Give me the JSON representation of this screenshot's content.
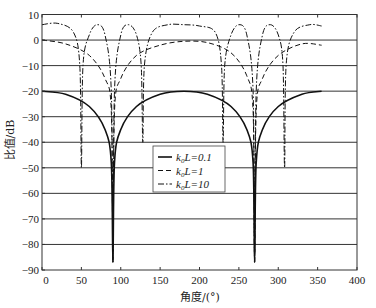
{
  "chart_data": {
    "type": "line",
    "title": "",
    "xlabel": "角度/(°)",
    "ylabel": "比值/dB",
    "xlim": [
      0,
      400
    ],
    "ylim": [
      -90,
      10
    ],
    "xticks": [
      0,
      50,
      100,
      150,
      200,
      250,
      300,
      350,
      400
    ],
    "yticks": [
      10,
      0,
      -10,
      -20,
      -30,
      -40,
      -50,
      -60,
      -70,
      -80,
      -90
    ],
    "xtick_labels": [
      "0",
      "50",
      "100",
      "150",
      "200",
      "250",
      "300",
      "350",
      "400"
    ],
    "ytick_labels": [
      "10",
      "0",
      "−10",
      "−20",
      "−30",
      "−40",
      "−50",
      "−60",
      "−70",
      "−80",
      "−90"
    ],
    "grid": "horizontal",
    "legend_position": "center",
    "series": [
      {
        "name": "k0L=0.1",
        "style": "solid",
        "x": [
          0,
          30,
          60,
          80,
          88,
          90,
          92,
          100,
          120,
          150,
          180,
          210,
          240,
          260,
          268,
          270,
          272,
          280,
          300,
          330,
          355
        ],
        "y": [
          -20,
          -21.2,
          -26,
          -35,
          -48,
          -87,
          -48,
          -35,
          -26,
          -21.2,
          -20,
          -21.2,
          -26,
          -35,
          -48,
          -87,
          -48,
          -35,
          -26,
          -21.2,
          -20
        ]
      },
      {
        "name": "k0L=1",
        "style": "dashed",
        "x": [
          0,
          30,
          60,
          80,
          88,
          90,
          92,
          100,
          120,
          150,
          180,
          210,
          240,
          260,
          268,
          270,
          272,
          280,
          300,
          330,
          355
        ],
        "y": [
          0,
          -1.5,
          -6,
          -15,
          -28,
          -87,
          -28,
          -15,
          -6,
          -2,
          -0.5,
          -1,
          -5,
          -14,
          -28,
          -87,
          -28,
          -15,
          -6,
          -1.5,
          -2
        ]
      },
      {
        "name": "k0L=10",
        "style": "dash-dot",
        "x": [
          0,
          20,
          40,
          48,
          50,
          52,
          60,
          70,
          80,
          88,
          90,
          92,
          100,
          110,
          120,
          126,
          128,
          130,
          140,
          160,
          180,
          200,
          220,
          228,
          230,
          232,
          240,
          250,
          260,
          268,
          270,
          272,
          280,
          290,
          300,
          306,
          308,
          310,
          320,
          340,
          355
        ],
        "y": [
          6,
          6.5,
          3,
          -10,
          -50,
          -10,
          2,
          6,
          2,
          -20,
          -87,
          -20,
          2,
          6,
          2,
          -10,
          -40,
          -10,
          3,
          6,
          6,
          5.5,
          3,
          -10,
          -40,
          -10,
          2,
          6,
          2,
          -20,
          -87,
          -20,
          2,
          6,
          2,
          -10,
          -50,
          -10,
          3,
          6,
          5.5
        ]
      }
    ]
  },
  "legend": {
    "items": [
      {
        "style": "solid",
        "label_prefix": "k",
        "label_sub": "0",
        "label_suffix": "L=0.1"
      },
      {
        "style": "dashed",
        "label_prefix": "k",
        "label_sub": "0",
        "label_suffix": "L=1"
      },
      {
        "style": "dash-dot",
        "label_prefix": "k",
        "label_sub": "0",
        "label_suffix": "L=10"
      }
    ]
  },
  "colors": {
    "line": "#111111",
    "grid": "#333333",
    "frame": "#333333",
    "background": "#ffffff"
  }
}
